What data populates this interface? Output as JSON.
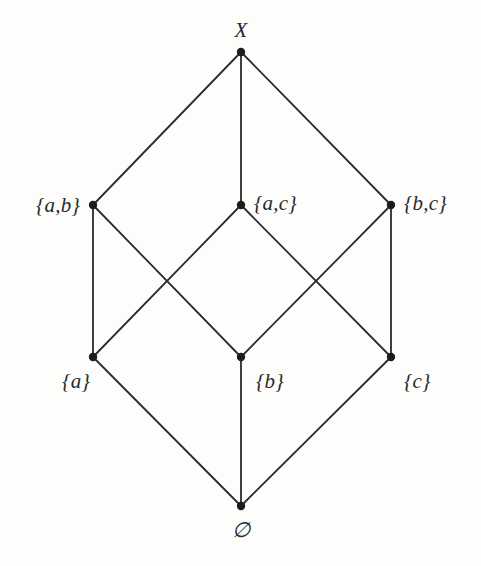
{
  "diagram": {
    "type": "hasse-diagram",
    "canvas": {
      "width": 481,
      "height": 566
    },
    "style": {
      "background_color": "#fdfdfb",
      "edge_color": "#2b2b2b",
      "node_color": "#1c1c1c",
      "label_color": "#2a2a2a",
      "edge_width": 1.8,
      "node_radius": 4.2,
      "label_font_size": 21
    },
    "nodes": [
      {
        "id": "X",
        "label": "X",
        "x": 241,
        "y": 52,
        "label_x": 241,
        "label_y": 30,
        "anchor": "center"
      },
      {
        "id": "ab",
        "label": "{a,b}",
        "x": 93,
        "y": 205,
        "label_x": 80,
        "label_y": 205,
        "anchor": "right"
      },
      {
        "id": "ac",
        "label": "{a,c}",
        "x": 241,
        "y": 205,
        "label_x": 254,
        "label_y": 203,
        "anchor": "left"
      },
      {
        "id": "bc",
        "label": "{b,c}",
        "x": 391,
        "y": 205,
        "label_x": 404,
        "label_y": 203,
        "anchor": "left"
      },
      {
        "id": "a",
        "label": "{a}",
        "x": 93,
        "y": 357,
        "label_x": 90,
        "label_y": 381,
        "anchor": "right"
      },
      {
        "id": "b",
        "label": "{b}",
        "x": 241,
        "y": 357,
        "label_x": 256,
        "label_y": 381,
        "anchor": "left"
      },
      {
        "id": "c",
        "label": "{c}",
        "x": 391,
        "y": 357,
        "label_x": 404,
        "label_y": 381,
        "anchor": "left"
      },
      {
        "id": "nil",
        "label": "∅",
        "x": 241,
        "y": 506,
        "label_x": 241,
        "label_y": 530,
        "anchor": "center"
      }
    ],
    "edges": [
      {
        "from": "X",
        "to": "ab",
        "name": "edge-x-ab"
      },
      {
        "from": "X",
        "to": "ac",
        "name": "edge-x-ac"
      },
      {
        "from": "X",
        "to": "bc",
        "name": "edge-x-bc"
      },
      {
        "from": "ab",
        "to": "a",
        "name": "edge-ab-a"
      },
      {
        "from": "ab",
        "to": "b",
        "name": "edge-ab-b"
      },
      {
        "from": "ac",
        "to": "a",
        "name": "edge-ac-a"
      },
      {
        "from": "ac",
        "to": "c",
        "name": "edge-ac-c"
      },
      {
        "from": "bc",
        "to": "b",
        "name": "edge-bc-b"
      },
      {
        "from": "bc",
        "to": "c",
        "name": "edge-bc-c"
      },
      {
        "from": "a",
        "to": "nil",
        "name": "edge-a-empty"
      },
      {
        "from": "b",
        "to": "nil",
        "name": "edge-b-empty"
      },
      {
        "from": "c",
        "to": "nil",
        "name": "edge-c-empty"
      }
    ]
  }
}
